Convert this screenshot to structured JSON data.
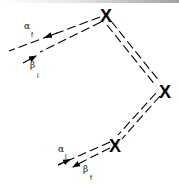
{
  "diagram": {
    "type": "feynman-like vertex diagram",
    "vertices": [
      {
        "id": "top",
        "glyph": "X"
      },
      {
        "id": "right",
        "glyph": "X"
      },
      {
        "id": "bottom",
        "glyph": "X"
      }
    ],
    "labels": {
      "alpha_f": {
        "symbol": "α",
        "subscript": "f"
      },
      "beta_i": {
        "symbol": "β",
        "subscript": "i"
      },
      "alpha_i": {
        "symbol": "α",
        "subscript": "i"
      },
      "beta_f": {
        "symbol": "β",
        "subscript": "f"
      }
    },
    "colors": {
      "line": "#000000",
      "background": "#ffffff"
    }
  }
}
